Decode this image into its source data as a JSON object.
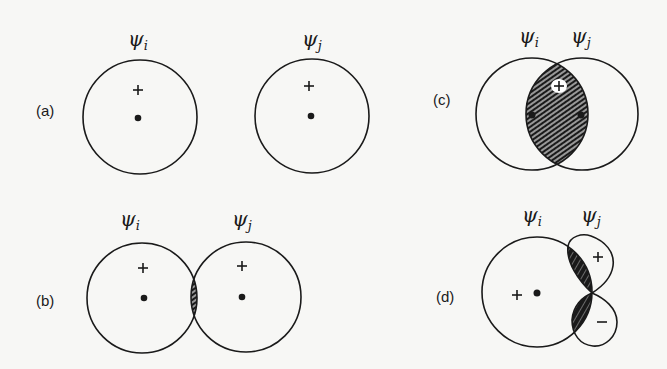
{
  "figure": {
    "colors": {
      "ink": "#1a1a1a",
      "background": "#f7f7f5",
      "hatch_light": "#ffffff"
    },
    "psi_symbol": "ψ",
    "panels": {
      "a": {
        "label": "(a)",
        "label_pos": [
          36,
          116
        ],
        "orbital_i": {
          "symbol": "ψ",
          "subscript": "i",
          "label_pos": [
            128,
            46
          ],
          "center": [
            140,
            117
          ],
          "r": 57,
          "nucleus": [
            138,
            118
          ],
          "sign": "+",
          "sign_pos": [
            138,
            90
          ]
        },
        "orbital_j": {
          "symbol": "ψ",
          "subscript": "j",
          "label_pos": [
            302,
            46
          ],
          "center": [
            312,
            116
          ],
          "r": 57,
          "nucleus": [
            311,
            116
          ],
          "sign": "+",
          "sign_pos": [
            309,
            86
          ]
        },
        "overlap": "none"
      },
      "b": {
        "label": "(b)",
        "label_pos": [
          36,
          306
        ],
        "orbital_i": {
          "symbol": "ψ",
          "subscript": "i",
          "label_pos": [
            120,
            228
          ],
          "center": [
            142,
            298
          ],
          "r": 55,
          "nucleus": [
            144,
            298
          ],
          "sign": "+",
          "sign_pos": [
            143,
            268
          ]
        },
        "orbital_j": {
          "symbol": "ψ",
          "subscript": "j",
          "label_pos": [
            232,
            228
          ],
          "center": [
            246,
            297
          ],
          "r": 55,
          "nucleus": [
            242,
            297
          ],
          "sign": "+",
          "sign_pos": [
            242,
            266
          ]
        },
        "overlap": "small positive (hatched lens)"
      },
      "c": {
        "label": "(c)",
        "label_pos": [
          433,
          105
        ],
        "orbital_i": {
          "symbol": "ψ",
          "subscript": "i",
          "label_pos": [
            519,
            45
          ],
          "center": [
            532,
            114
          ],
          "r": 56,
          "nucleus": [
            532,
            115
          ]
        },
        "orbital_j": {
          "symbol": "ψ",
          "subscript": "j",
          "label_pos": [
            571,
            45
          ],
          "center": [
            582,
            114
          ],
          "r": 56,
          "nucleus": [
            581,
            115
          ]
        },
        "sign": "+",
        "sign_pos": [
          559,
          86
        ],
        "overlap": "large positive (hatched lens)"
      },
      "d": {
        "label": "(d)",
        "label_pos": [
          436,
          302
        ],
        "orbital_i": {
          "symbol": "ψ",
          "subscript": "i",
          "label_pos": [
            522,
            224
          ],
          "center": [
            537,
            292
          ],
          "r": 55,
          "nucleus": [
            537,
            293
          ],
          "sign": "+",
          "sign_pos": [
            517,
            295
          ]
        },
        "orbital_j": {
          "symbol": "ψ",
          "subscript": "j",
          "label_pos": [
            581,
            224
          ],
          "type": "p-orbital",
          "node": [
            592,
            293
          ],
          "upper_lobe": {
            "sign": "+",
            "sign_pos": [
              598,
              257
            ]
          },
          "lower_lobe": {
            "sign": "−",
            "sign_pos": [
              602,
              322
            ]
          }
        },
        "overlap": "zero net (positive and negative regions cancel)"
      }
    }
  }
}
